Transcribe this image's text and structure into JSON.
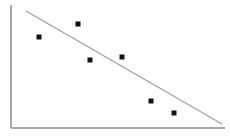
{
  "figure": {
    "width": 230,
    "height": 139,
    "background_color": "#ffffff",
    "axis_color": "#a8a8a8",
    "trend_line_color": "#9a9a9a",
    "marker_color": "#111111",
    "marker_size_px": 5
  },
  "axes": {
    "y_axis": {
      "x": 11,
      "y_top": 5,
      "y_bottom": 128
    },
    "x_axis": {
      "y": 128,
      "x_left": 11,
      "x_right": 225
    },
    "x_title": "",
    "y_title": "",
    "x_tick_labels": [],
    "y_tick_labels": [],
    "title": ""
  },
  "trend_line": {
    "x1": 26,
    "y1": 11,
    "x2": 222,
    "y2": 124
  },
  "chart_data": {
    "type": "scatter",
    "title": "",
    "xlabel": "",
    "ylabel": "",
    "grid": false,
    "legend": false,
    "xlim": [
      0,
      100
    ],
    "ylim": [
      0,
      100
    ],
    "x": [
      13,
      31,
      37,
      52,
      65,
      76
    ],
    "y": [
      74,
      85,
      55,
      58,
      22,
      12
    ],
    "pixel_points": [
      {
        "cx": 39,
        "cy": 37
      },
      {
        "cx": 78,
        "cy": 24
      },
      {
        "cx": 90,
        "cy": 60
      },
      {
        "cx": 122,
        "cy": 57
      },
      {
        "cx": 151,
        "cy": 101
      },
      {
        "cx": 174,
        "cy": 113
      }
    ],
    "series": [
      {
        "name": "observations",
        "marker": "square",
        "color": "#111111",
        "values": [
          74,
          85,
          55,
          58,
          22,
          12
        ]
      }
    ],
    "annotations": [
      {
        "type": "trendline",
        "label": "",
        "direction": "negative",
        "color": "#9a9a9a"
      }
    ]
  }
}
